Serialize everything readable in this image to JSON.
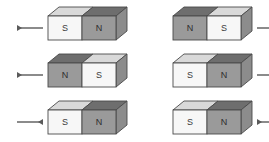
{
  "figure": {
    "background_color": "#ffffff",
    "width": 269,
    "height": 142
  },
  "colors": {
    "light_face": "#f7f7f7",
    "dark_face": "#9a9a9a",
    "top_face_light": "#d9d9d9",
    "top_face_dark": "#6e6e6e",
    "end_face": "#8c8c8c",
    "outline": "#4a4a4a",
    "label_text": "#3a3a3a",
    "arrow": "#5a5a5a"
  },
  "geometry": {
    "magnet_width": 68,
    "magnet_height": 24,
    "depth_x": 11,
    "depth_y": 9,
    "rows_y": [
      16,
      63,
      110
    ],
    "col_x": [
      48,
      173
    ],
    "arrow_length": 26
  },
  "rows": [
    {
      "row_index": 1,
      "magnets": [
        {
          "id": "r1c1",
          "left_pole": "S",
          "right_pole": "N",
          "left_face_shade": "light",
          "right_face_shade": "dark",
          "arrow": {
            "side": "left",
            "direction": "left",
            "glyph": "left-arrow"
          }
        },
        {
          "id": "r1c2",
          "left_pole": "N",
          "right_pole": "S",
          "left_face_shade": "dark",
          "right_face_shade": "light",
          "arrow": {
            "side": "right",
            "direction": "right",
            "glyph": "right-arrow"
          }
        }
      ]
    },
    {
      "row_index": 2,
      "magnets": [
        {
          "id": "r2c1",
          "left_pole": "N",
          "right_pole": "S",
          "left_face_shade": "dark",
          "right_face_shade": "light",
          "arrow": {
            "side": "left",
            "direction": "left",
            "glyph": "left-arrow"
          }
        },
        {
          "id": "r2c2",
          "left_pole": "S",
          "right_pole": "N",
          "left_face_shade": "light",
          "right_face_shade": "dark",
          "arrow": {
            "side": "right",
            "direction": "right",
            "glyph": "right-arrow"
          }
        }
      ]
    },
    {
      "row_index": 3,
      "magnets": [
        {
          "id": "r3c1",
          "left_pole": "S",
          "right_pole": "N",
          "left_face_shade": "light",
          "right_face_shade": "dark",
          "arrow": {
            "side": "left",
            "direction": "right",
            "glyph": "right-arrow"
          }
        },
        {
          "id": "r3c2",
          "left_pole": "S",
          "right_pole": "N",
          "left_face_shade": "light",
          "right_face_shade": "dark",
          "arrow": {
            "side": "right",
            "direction": "left",
            "glyph": "left-arrow"
          }
        }
      ]
    }
  ]
}
